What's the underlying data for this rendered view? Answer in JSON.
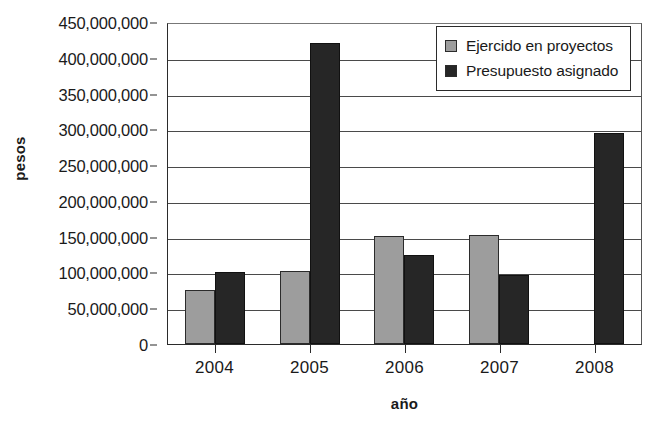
{
  "chart_data": {
    "type": "bar",
    "title": "",
    "xlabel": "año",
    "ylabel": "pesos",
    "categories": [
      "2004",
      "2005",
      "2006",
      "2007",
      "2008"
    ],
    "series": [
      {
        "name": "Ejercido en proyectos",
        "color": "#9d9d9d",
        "values": [
          75000000,
          102000000,
          151000000,
          153000000,
          0
        ]
      },
      {
        "name": "Presupuesto asignado",
        "color": "#262626",
        "values": [
          100000000,
          420000000,
          124000000,
          96000000,
          295000000
        ]
      }
    ],
    "ylim": [
      0,
      450000000
    ],
    "ytick_values": [
      0,
      50000000,
      100000000,
      150000000,
      200000000,
      250000000,
      300000000,
      350000000,
      400000000,
      450000000
    ],
    "ytick_labels": [
      "0",
      "50,000,000",
      "100,000,000",
      "150,000,000",
      "200,000,000",
      "250,000,000",
      "300,000,000",
      "350,000,000",
      "400,000,000",
      "450,000,000"
    ],
    "grid": true,
    "grid_axis": "y",
    "legend_position": "top-right"
  }
}
